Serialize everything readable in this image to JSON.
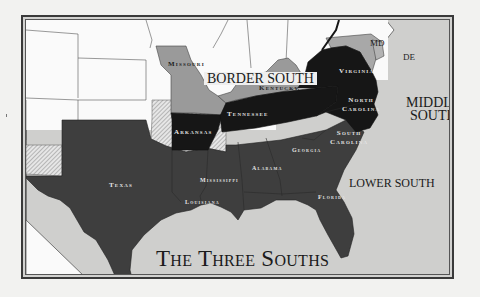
{
  "map": {
    "title": "The Three Souths",
    "colors": {
      "background_page": "#f2f2f0",
      "water": "#cfcfcd",
      "non_south_states": "#fafafa",
      "border_south": "#9a9a9a",
      "middle_south": "#161616",
      "lower_south": "#3e3e3e",
      "territory_hatch": "#b9b9b9",
      "frame": "#3a3a3a"
    },
    "regions": {
      "border_south": "BORDER SOUTH",
      "middle_south": [
        "MIDDLE",
        "SOUTH"
      ],
      "lower_south": "LOWER SOUTH"
    },
    "states": {
      "missouri": "Missouri",
      "kentucky": "Kentucky",
      "maryland": "MD",
      "delaware": "DE",
      "virginia": "Virginia",
      "north_carolina": [
        "North",
        "Carolina"
      ],
      "tennessee": "Tennessee",
      "arkansas": "Arkansas",
      "south_carolina": [
        "South",
        "Carolina"
      ],
      "georgia": "Georgia",
      "alabama": "Alabama",
      "mississippi": "Mississippi",
      "louisiana": "Louisiana",
      "texas": "Texas",
      "florida": "Florida"
    },
    "legend_groups": {
      "border_south": [
        "Missouri",
        "Kentucky",
        "Maryland",
        "Delaware"
      ],
      "middle_south": [
        "Virginia",
        "North Carolina",
        "Tennessee",
        "Arkansas"
      ],
      "lower_south": [
        "South Carolina",
        "Georgia",
        "Alabama",
        "Mississippi",
        "Louisiana",
        "Texas",
        "Florida"
      ]
    }
  }
}
